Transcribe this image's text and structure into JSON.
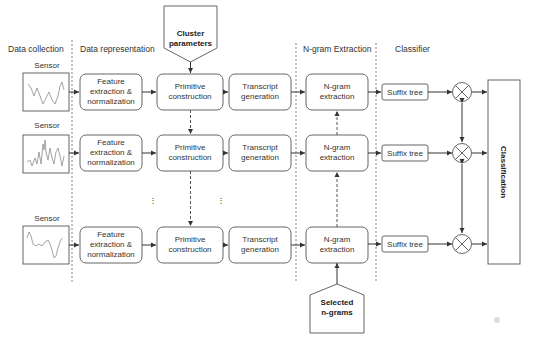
{
  "stages": {
    "data_collection": "Data collection",
    "data_representation": "Data representation",
    "ngram_extraction": "N-gram Extraction",
    "classifier": "Classifier"
  },
  "inputs": {
    "cluster_parameters": [
      "Cluster",
      "parameters"
    ],
    "selected_ngrams": [
      "Selected",
      "n-grams"
    ]
  },
  "rows": [
    {
      "sensor": "Sensor",
      "feature": [
        "Feature",
        "extraction &",
        "normalization"
      ],
      "primitive": [
        "Primitive",
        "construction"
      ],
      "transcript": [
        "Transcript",
        "generation"
      ],
      "ngram": [
        "N-gram",
        "extraction"
      ],
      "suffix": "Suffix tree"
    },
    {
      "sensor": "Sensor",
      "feature": [
        "Feature",
        "extraction &",
        "normalization"
      ],
      "primitive": [
        "Primitive",
        "construction"
      ],
      "transcript": [
        "Transcript",
        "generation"
      ],
      "ngram": [
        "N-gram",
        "extraction"
      ],
      "suffix": "Suffix tree"
    },
    {
      "sensor": "Sensor",
      "feature": [
        "Feature",
        "extraction &",
        "normalization"
      ],
      "primitive": [
        "Primitive",
        "construction"
      ],
      "transcript": [
        "Transcript",
        "generation"
      ],
      "ngram": [
        "N-gram",
        "extraction"
      ],
      "suffix": "Suffix tree"
    }
  ],
  "ellipsis": "⋮",
  "classification": "Classification",
  "icons": {
    "combiner": "circle-x-icon",
    "sensor_plot": "waveform-icon"
  }
}
